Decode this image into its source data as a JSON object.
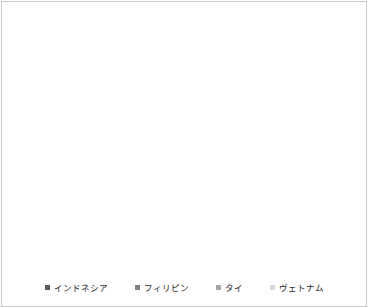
{
  "chart_data": {
    "type": "area",
    "stacked": true,
    "title": "",
    "xlabel": "",
    "ylabel": "",
    "categories": [
      "2000",
      "2001",
      "2002",
      "2003",
      "2004",
      "2005",
      "2006",
      "2007",
      "2008",
      "2009",
      "2010",
      "2011",
      "2012",
      "2013",
      "2014",
      "2015",
      "2016",
      "2017",
      "2018",
      "2019",
      "2020",
      "2021",
      "2022"
    ],
    "series": [
      {
        "name": "インドネシア",
        "color": "#595959",
        "values": [
          4000,
          4160,
          4600,
          4800,
          5030,
          5460,
          5900,
          5680,
          6550,
          6760,
          7200,
          7850,
          6680,
          7100,
          7800,
          8300,
          10700,
          11100,
          11400,
          11660,
          11310,
          11530,
          11960
        ]
      },
      {
        "name": "フィリピン",
        "color": "#7f7f7f",
        "values": [
          2900,
          2600,
          2600,
          2400,
          2380,
          2390,
          2290,
          1650,
          1950,
          1950,
          3590,
          4110,
          4200,
          3260,
          5680,
          8800,
          7900,
          7150,
          6410,
          5720,
          5420,
          4550,
          4340
        ]
      },
      {
        "name": "タイ",
        "color": "#a6a6a6",
        "values": [
          850,
          830,
          860,
          900,
          960,
          990,
          960,
          820,
          900,
          1250,
          1400,
          1740,
          1390,
          1040,
          2170,
          2600,
          3100,
          3250,
          3120,
          3250,
          3470,
          3470,
          3680
        ]
      },
      {
        "name": "ヴェトナム",
        "color": "#d9d9d9",
        "values": [
          800,
          780,
          740,
          750,
          780,
          830,
          1000,
          910,
          900,
          1250,
          1150,
          1730,
          1430,
          690,
          2150,
          2500,
          3900,
          3460,
          3730,
          4200,
          4120,
          4110,
          4120
        ]
      }
    ],
    "ylim": [
      0,
      30000
    ],
    "y_tick_step": 5000,
    "y_tick_labels": [
      "0",
      "5000",
      "10000",
      "15000",
      "20000",
      "25000",
      "30000"
    ],
    "grid": "horizontal",
    "gridline_color": "#d9d9d9",
    "axis_line_color": "#bfbfbf",
    "tick_label_color": "#262626",
    "legend_position": "bottom",
    "legend_marker": "square"
  }
}
